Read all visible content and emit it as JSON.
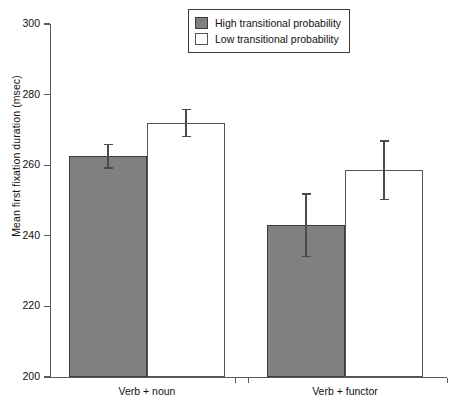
{
  "chart_data": {
    "type": "bar",
    "title": "",
    "xlabel": "",
    "ylabel": "Mean first fixation duration (msec)",
    "ylim": [
      200,
      300
    ],
    "yticks": [
      200,
      220,
      240,
      260,
      280,
      300
    ],
    "ytick_labels": [
      "200",
      "220",
      "240",
      "260",
      "280",
      "300"
    ],
    "grid": false,
    "legend_position": "top-center",
    "categories": [
      "Verb + noun",
      "Verb + functor"
    ],
    "series": [
      {
        "name": "High transitional probability",
        "color": "#808080",
        "values": [
          262.5,
          243.0
        ],
        "errors": [
          3.5,
          9.0
        ]
      },
      {
        "name": "Low transitional probability",
        "color": "#ffffff",
        "values": [
          272.0,
          258.5
        ],
        "errors": [
          4.0,
          8.5
        ]
      }
    ]
  },
  "axis": {
    "y_title": "Mean first fixation duration (msec)",
    "y_tick_labels": [
      "300",
      "280",
      "260",
      "240",
      "220",
      "200"
    ]
  },
  "legend": {
    "items": [
      {
        "label": "High transitional probability",
        "swatch": "filled-gray-swatch"
      },
      {
        "label": "Low transitional probability",
        "swatch": "hollow-white-swatch"
      }
    ]
  },
  "categories": [
    {
      "label": "Verb + noun"
    },
    {
      "label": "Verb + functor"
    }
  ]
}
